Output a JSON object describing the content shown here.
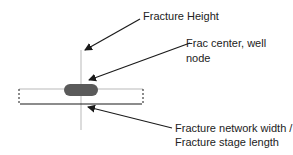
{
  "labels": {
    "height": "Fracture Height",
    "center_line1": "Frac center, well",
    "center_line2": "node",
    "width_line1": "Fracture network width /",
    "width_line2": "Fracture stage length"
  },
  "colors": {
    "guide_line": "#d0d0d0",
    "node": "#5a5a5a",
    "arrow": "#1a1a1a"
  }
}
